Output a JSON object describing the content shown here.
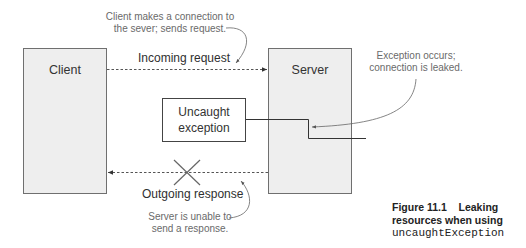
{
  "diagram": {
    "nodes": {
      "client": {
        "label": "Client"
      },
      "server": {
        "label": "Server"
      },
      "uncaught": {
        "line1": "Uncaught",
        "line2": "exception"
      }
    },
    "flows": {
      "incoming": {
        "label": "Incoming request",
        "direction": "client-to-server"
      },
      "outgoing": {
        "label": "Outgoing response",
        "direction": "server-to-client",
        "blocked": true
      }
    },
    "annotations": {
      "connect": {
        "line1": "Client makes a connection to",
        "line2": "the sever; sends request."
      },
      "exception": {
        "line1": "Exception occurs;",
        "line2": "connection is leaked."
      },
      "unable": {
        "line1": "Server is unable to",
        "line2": "send a response."
      }
    },
    "caption": {
      "number": "Figure 11.1",
      "text_line1": "Leaking",
      "text_line2": "resources when using",
      "code": "uncaughtException"
    },
    "colors": {
      "box_fill": "#eeeeee",
      "box_border": "#6f6f6f",
      "line": "#555555",
      "annotation_text": "#6a6a6a"
    }
  }
}
